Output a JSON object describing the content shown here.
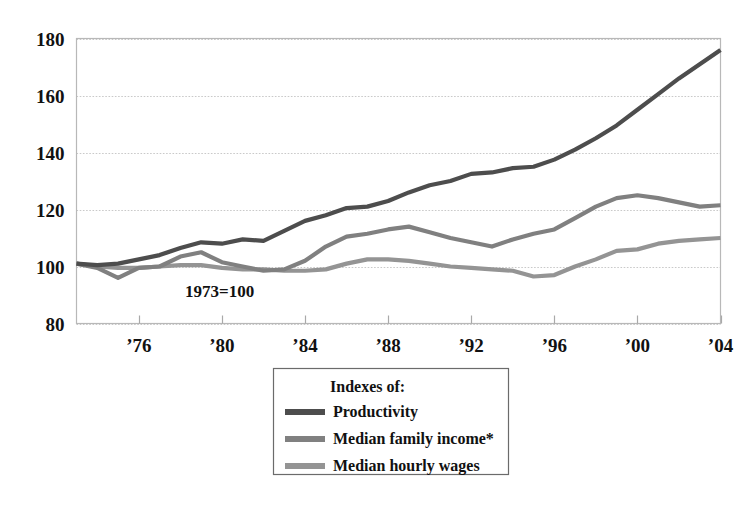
{
  "chart_data": {
    "type": "line",
    "title": "",
    "subtitle": "",
    "annotation": "1973=100",
    "xlabel": "",
    "ylabel": "",
    "xlim": [
      1973,
      2004
    ],
    "ylim": [
      80,
      180
    ],
    "grid": true,
    "legend_position": "below-center",
    "legend_title": "Indexes of:",
    "y_ticks": [
      80,
      100,
      120,
      140,
      160,
      180
    ],
    "y_tick_labels": [
      "80",
      "100",
      "120",
      "140",
      "160",
      "180"
    ],
    "x_ticks": [
      1976,
      1980,
      1984,
      1988,
      1992,
      1996,
      2000,
      2004
    ],
    "x_tick_labels": [
      "’76",
      "’80",
      "’84",
      "’88",
      "’92",
      "’96",
      "’00",
      "’04"
    ],
    "x": [
      1973,
      1974,
      1975,
      1976,
      1977,
      1978,
      1979,
      1980,
      1981,
      1982,
      1983,
      1984,
      1985,
      1986,
      1987,
      1988,
      1989,
      1990,
      1991,
      1992,
      1993,
      1994,
      1995,
      1996,
      1997,
      1998,
      1999,
      2000,
      2001,
      2002,
      2003,
      2004
    ],
    "series": [
      {
        "name": "Productivity",
        "color": "#4d4d4d",
        "width": 4.2,
        "values": [
          101,
          100.5,
          101,
          102.5,
          104,
          106.5,
          108.5,
          108,
          109.5,
          109,
          112.5,
          116,
          118,
          120.5,
          121,
          123,
          126,
          128.5,
          130,
          132.5,
          133,
          134.5,
          135,
          137.5,
          141,
          145,
          149.5,
          155,
          160.5,
          166,
          171,
          176
        ]
      },
      {
        "name": "Median family income*",
        "color": "#808080",
        "width": 4.2,
        "values": [
          101,
          99.5,
          96,
          99.5,
          100,
          103.5,
          105,
          101.5,
          100,
          98.5,
          99,
          102,
          107,
          110.5,
          111.5,
          113,
          114,
          112,
          110,
          108.5,
          107,
          109.5,
          111.5,
          113,
          117,
          121,
          124,
          125,
          124,
          122.5,
          121,
          121.5
        ]
      },
      {
        "name": "Median hourly wages",
        "color": "#949494",
        "width": 4.2,
        "values": [
          101,
          100,
          99.5,
          99.5,
          100,
          100.5,
          100.5,
          99.5,
          99,
          99,
          98.5,
          98.5,
          99,
          101,
          102.5,
          102.5,
          102,
          101,
          100,
          99.5,
          99,
          98.5,
          96.5,
          97,
          100,
          102.5,
          105.5,
          106,
          108,
          109,
          109.5,
          110
        ]
      }
    ]
  },
  "legend": {
    "title": "Indexes of:",
    "items": [
      {
        "label": "Productivity",
        "color": "#4d4d4d"
      },
      {
        "label": "Median family income*",
        "color": "#808080"
      },
      {
        "label": "Median hourly wages",
        "color": "#949494"
      }
    ]
  },
  "axes": {
    "annotation": "1973=100"
  }
}
